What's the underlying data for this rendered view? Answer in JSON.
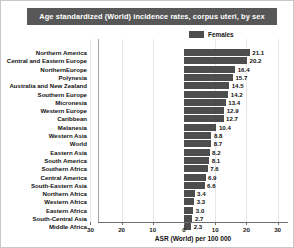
{
  "title": "Age standardized (World) incidence rates, corpus uteri, by sex",
  "legend": {
    "entries": [
      {
        "label": "Females",
        "color": "#4d4d4d"
      }
    ]
  },
  "axis": {
    "xlabel": "ASR (World) per 100 000",
    "tick_labels": [
      "30",
      "20",
      "10",
      "0",
      "10",
      "20",
      "30"
    ]
  },
  "chart_data": {
    "type": "bar",
    "orientation": "horizontal",
    "title": "Age standardized (World) incidence rates, corpus uteri, by sex",
    "xlabel": "ASR (World) per 100 000",
    "ylabel": "",
    "xlim": [
      -35,
      35
    ],
    "xticks": [
      -30,
      -20,
      -10,
      0,
      10,
      20,
      30
    ],
    "xticklabels": [
      "30",
      "20",
      "10",
      "0",
      "10",
      "20",
      "30"
    ],
    "grid": true,
    "legend_position": "top-right",
    "bar_color": "#4d4d4d",
    "categories": [
      "Northern America",
      "Central and Eastern Europe",
      "NorthernEurope",
      "Polynesia",
      "Australia and New Zealand",
      "Southern Europe",
      "Micronesia",
      "Western Europe",
      "Caribbean",
      "Melanesia",
      "Western Asia",
      "World",
      "Eastern Asia",
      "South America",
      "Southern Africa",
      "Central America",
      "South-Eastern Asia",
      "Northern Africa",
      "Western Africa",
      "Eastern Africa",
      "South-Central Asia",
      "Middle Africa"
    ],
    "series": [
      {
        "name": "Females",
        "color": "#4d4d4d",
        "values": [
          21.1,
          20.2,
          16.4,
          15.7,
          14.5,
          14.2,
          13.4,
          12.9,
          12.7,
          10.4,
          8.8,
          8.7,
          8.2,
          8.1,
          7.6,
          6.9,
          6.6,
          3.4,
          3.3,
          3.0,
          2.7,
          2.3
        ]
      }
    ]
  }
}
